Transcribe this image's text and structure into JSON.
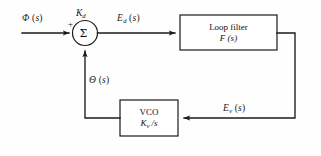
{
  "diagram": {
    "type": "control-system-block-diagram",
    "background_color": "#fefefe",
    "line_color": "#1a1a1a",
    "signals": {
      "input": {
        "symbol": "Φ",
        "subscript": "",
        "argument": "(s)",
        "full": "Φ (s)"
      },
      "error": {
        "symbol": "E",
        "subscript": "d",
        "argument": "(s)",
        "full": "E_d (s)"
      },
      "feedback_voltage": {
        "symbol": "E",
        "subscript": "v",
        "argument": "(s)",
        "full": "E_v (s)"
      },
      "feedback_phase": {
        "symbol": "Θ",
        "subscript": "",
        "argument": "(s)",
        "full": "Θ (s)"
      }
    },
    "summing_junction": {
      "glyph": "Σ",
      "gain_symbol": "K",
      "gain_subscript": "d",
      "gain_full": "K_d",
      "input_sign": "+"
    },
    "blocks": [
      {
        "id": "loop-filter",
        "name_line": "Loop filter",
        "transfer_line_symbol": "F",
        "transfer_line_arg": "(s)",
        "transfer_full": "F (s)"
      },
      {
        "id": "vco",
        "name_line": "VCO",
        "transfer_line_symbol": "K",
        "transfer_line_subscript": "v",
        "transfer_line_arg": "/s",
        "transfer_full": "K_v /s"
      }
    ]
  }
}
